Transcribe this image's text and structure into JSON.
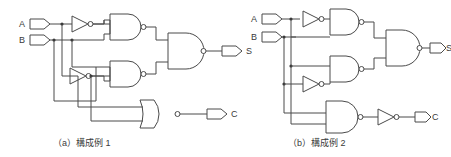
{
  "figure": {
    "title": "",
    "background_color": "#ffffff",
    "line_color": "#4a4a4a",
    "text_color": "#3a3a3a"
  },
  "circuits": [
    {
      "id": "a",
      "caption": "（a）構成例 1",
      "inputs": [
        {
          "label": "A",
          "name": "input-a"
        },
        {
          "label": "B",
          "name": "input-b"
        }
      ],
      "outputs": [
        {
          "label": "S",
          "name": "output-s"
        },
        {
          "label": "C",
          "name": "output-c"
        }
      ],
      "gates": [
        {
          "name": "inverter-1",
          "type": "NOT"
        },
        {
          "name": "inverter-2",
          "type": "NOT"
        },
        {
          "name": "nand-1",
          "type": "NAND"
        },
        {
          "name": "nand-2",
          "type": "NAND"
        },
        {
          "name": "nand-3",
          "type": "NAND"
        },
        {
          "name": "nor-1",
          "type": "NOR"
        }
      ]
    },
    {
      "id": "b",
      "caption": "（b）構成例 2",
      "inputs": [
        {
          "label": "A",
          "name": "input-a"
        },
        {
          "label": "B",
          "name": "input-b"
        }
      ],
      "outputs": [
        {
          "label": "S",
          "name": "output-s"
        },
        {
          "label": "C",
          "name": "output-c"
        }
      ],
      "gates": [
        {
          "name": "inverter-1",
          "type": "NOT"
        },
        {
          "name": "inverter-2",
          "type": "NOT"
        },
        {
          "name": "inverter-3",
          "type": "NOT"
        },
        {
          "name": "nand-1",
          "type": "NAND"
        },
        {
          "name": "nand-2",
          "type": "NAND"
        },
        {
          "name": "nand-3",
          "type": "NAND"
        },
        {
          "name": "nand-4",
          "type": "NAND"
        }
      ]
    }
  ]
}
